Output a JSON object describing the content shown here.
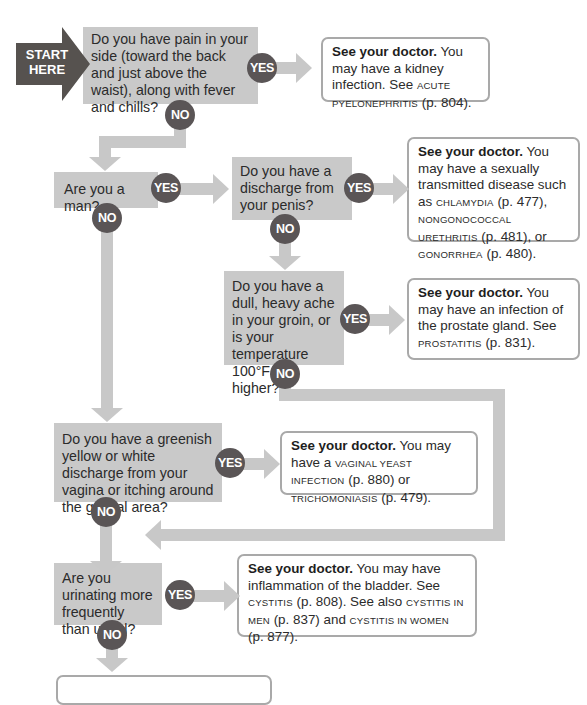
{
  "start": {
    "line1": "START",
    "line2": "HERE"
  },
  "badges": {
    "yes": "YES",
    "no": "NO"
  },
  "questions": [
    {
      "id": "q1",
      "text": "Do you have pain in your side (toward the back and just above the waist), along with fever and chills?"
    },
    {
      "id": "q2",
      "text": "Are you a man?"
    },
    {
      "id": "q3",
      "text": "Do you have a discharge from your penis?"
    },
    {
      "id": "q4",
      "text": "Do you have a dull, heavy ache in your groin, or is your temperature 100°F or higher?"
    },
    {
      "id": "q5",
      "text": "Do you have a greenish yellow or white discharge from your vagina or itching around the genital area?"
    },
    {
      "id": "q6",
      "text": "Are you urinating more frequently than usual?"
    }
  ],
  "answers": {
    "a1": {
      "lead": "See your doctor.",
      "p1": " You may have a kidney infection. See ",
      "t1": "acute pyelonephritis",
      "p2": " (p. 804)."
    },
    "a3": {
      "lead": "See your doctor.",
      "p1": " You may have a sexually transmitted disease such as ",
      "t1": "chlamydia",
      "p2": " (p. 477), ",
      "t2": "nongonococcal urethritis",
      "p3": " (p. 481), or ",
      "t3": "gonorrhea",
      "p4": " (p. 480)."
    },
    "a4": {
      "lead": "See your doctor.",
      "p1": " You may have an infection of the prostate gland. See ",
      "t1": "prostatitis",
      "p2": " (p. 831)."
    },
    "a5": {
      "lead": "See your doctor.",
      "p1": " You may have a ",
      "t1": "vaginal yeast infection",
      "p2": " (p. 880) or ",
      "t2": "trichomoniasis",
      "p3": " (p. 479)."
    },
    "a6": {
      "lead": "See your doctor.",
      "p1": " You may have inflammation of the bladder. See ",
      "t1": "cystitis",
      "p2": " (p. 808). See also ",
      "t2": "cystitis in men",
      "p3": " (p. 837) and ",
      "t3": "cystitis in women",
      "p4": " (p. 877)."
    }
  },
  "colors": {
    "question_bg": "#c9c9c9",
    "badge": "#5a5556",
    "connector": "#c8c8c8",
    "start_arrow": "#56524f",
    "answer_border": "#a9a9a9"
  }
}
